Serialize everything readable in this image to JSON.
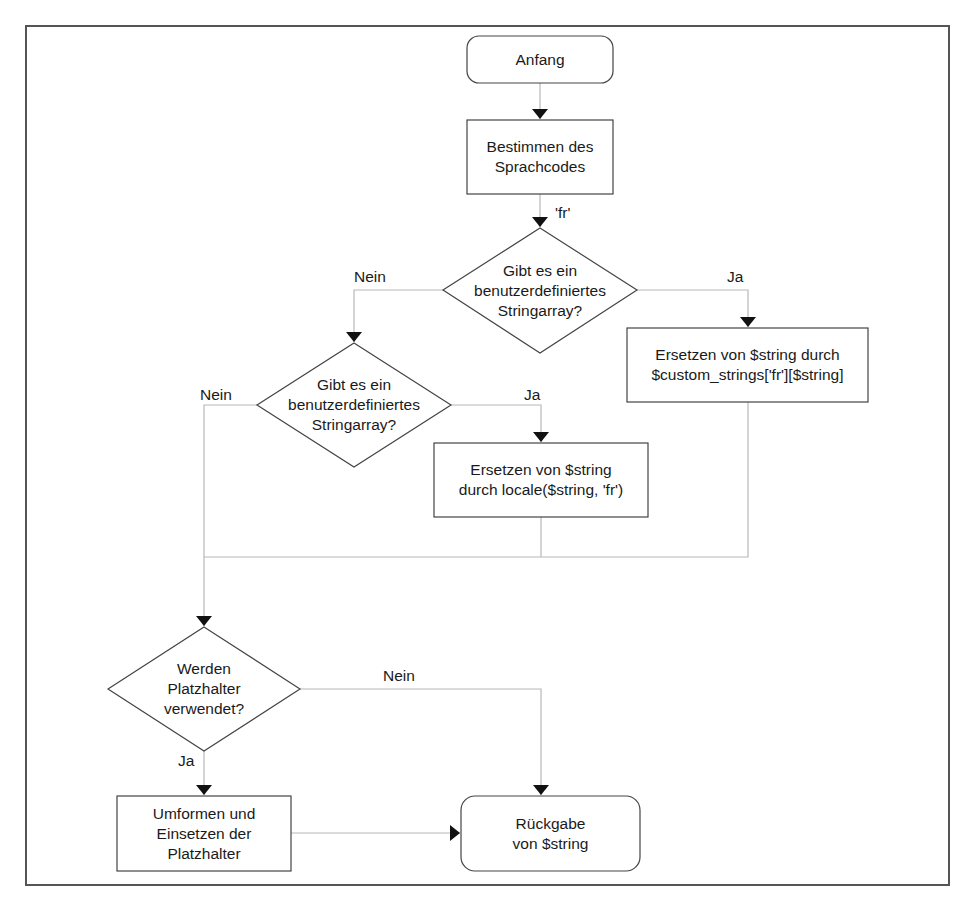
{
  "diagram": {
    "type": "flowchart",
    "nodes": {
      "start": {
        "shape": "terminal",
        "text": "Anfang"
      },
      "determine_lang": {
        "shape": "process",
        "text": "Bestimmen des\nSprachcodes"
      },
      "decision_custom": {
        "shape": "decision",
        "text": "Gibt es ein\nbenutzerdefiniertes\nStringarray?"
      },
      "replace_custom": {
        "shape": "process",
        "text": "Ersetzen von $string durch\n$custom_strings['fr'][$string]"
      },
      "decision_locale": {
        "shape": "decision",
        "text": "Gibt es ein\nbenutzerdefiniertes\nStringarray?"
      },
      "replace_locale": {
        "shape": "process",
        "text": "Ersetzen von $string\ndurch locale($string, 'fr')"
      },
      "decision_placeholder": {
        "shape": "decision",
        "text": "Werden\nPlatzhalter\nverwendet?"
      },
      "transform_placeholder": {
        "shape": "process",
        "text": "Umformen und\nEinsetzen der\nPlatzhalter"
      },
      "return": {
        "shape": "terminal",
        "text": "Rückgabe\nvon $string"
      }
    },
    "edge_labels": {
      "lang_code": "'fr'",
      "custom_no": "Nein",
      "custom_yes": "Ja",
      "locale_no": "Nein",
      "locale_yes": "Ja",
      "placeholder_no": "Nein",
      "placeholder_yes": "Ja"
    },
    "edges": [
      {
        "from": "start",
        "to": "determine_lang",
        "label": ""
      },
      {
        "from": "determine_lang",
        "to": "decision_custom",
        "label": "'fr'"
      },
      {
        "from": "decision_custom",
        "to": "replace_custom",
        "label": "Ja"
      },
      {
        "from": "decision_custom",
        "to": "decision_locale",
        "label": "Nein"
      },
      {
        "from": "decision_locale",
        "to": "replace_locale",
        "label": "Ja"
      },
      {
        "from": "decision_locale",
        "to": "decision_placeholder",
        "label": "Nein"
      },
      {
        "from": "replace_locale",
        "to": "decision_placeholder",
        "label": ""
      },
      {
        "from": "replace_custom",
        "to": "decision_placeholder",
        "label": ""
      },
      {
        "from": "decision_placeholder",
        "to": "transform_placeholder",
        "label": "Ja"
      },
      {
        "from": "decision_placeholder",
        "to": "return",
        "label": "Nein"
      },
      {
        "from": "transform_placeholder",
        "to": "return",
        "label": ""
      }
    ],
    "colors": {
      "stroke": "#444444",
      "connector": "#bbbbbb",
      "arrowhead": "#111111",
      "frame": "#555555"
    }
  }
}
